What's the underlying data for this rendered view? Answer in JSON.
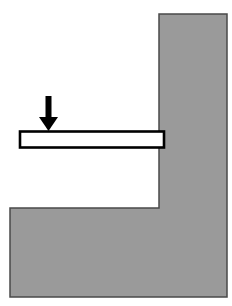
{
  "figure": {
    "type": "engineering-section-diagram",
    "canvas": {
      "width": 232,
      "height": 306,
      "background": "#ffffff"
    }
  },
  "colors": {
    "support_fill": "#9a9a9a",
    "support_stroke": "#4a4a4a",
    "beam_fill": "#ffffff",
    "beam_stroke": "#000000",
    "load_arrow": "#000000",
    "background": "#ffffff"
  },
  "shapes": {
    "support": {
      "label": "wall-support",
      "description": "Hatched grey L-shaped masonry support: vertical wall on the right, horizontal footing along the bottom",
      "points": "159,14 227,14 227,297 10,297 10,208 159,208",
      "fill": "#9a9a9a",
      "stroke": "#4a4a4a",
      "stroke_width": 1.5
    },
    "beam": {
      "label": "cantilever-beam",
      "description": "Hollow rectangular cantilever beam embedded into the wall",
      "x": 20,
      "y": 131.5,
      "width": 144,
      "height": 16,
      "fill": "#ffffff",
      "stroke": "#000000",
      "stroke_width": 2.6
    },
    "load_arrow": {
      "label": "point-load-arrow",
      "description": "Downward point load applied near the free end of the beam",
      "shaft": {
        "x": 45.5,
        "y": 96,
        "width": 6,
        "height": 22
      },
      "head": {
        "points": "39,117 58,117 48.5,131"
      },
      "fill": "#000000",
      "direction": "down",
      "tip_x": 48.5,
      "tip_y": 131
    }
  }
}
